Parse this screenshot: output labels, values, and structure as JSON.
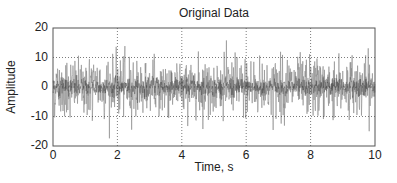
{
  "chart_data": {
    "type": "line",
    "title": "Original Data",
    "xlabel": "Time, s",
    "ylabel": "Amplitude",
    "xlim": [
      0,
      10
    ],
    "ylim": [
      -20,
      20
    ],
    "xticks": [
      0,
      2,
      4,
      6,
      8,
      10
    ],
    "xtick_labels": [
      "0",
      "2",
      "4",
      "6",
      "8",
      "10"
    ],
    "yticks": [
      20,
      10,
      0,
      -10,
      -20
    ],
    "ytick_labels": [
      "20",
      "10",
      "0",
      "-10",
      "-20"
    ],
    "grid": true,
    "grid_style": "dotted",
    "legend": null,
    "series": [
      {
        "name": "signal",
        "description": "dense random noise, roughly zero-mean, std approx 5, peaks reaching about +18 / -18",
        "x_range": [
          0,
          10
        ],
        "mean": 0,
        "std_approx": 5,
        "peak_max_approx": 18,
        "peak_min_approx": -18,
        "n_points_approx": 1000,
        "color": "#8a8a8a"
      }
    ]
  },
  "style": {
    "line_color": "#8a8a8a",
    "core_color": "#333333",
    "axis_color": "#555555",
    "grid_color": "#444444"
  },
  "plot_px": {
    "left": 53,
    "right": 375,
    "top": 28,
    "bottom": 146
  }
}
